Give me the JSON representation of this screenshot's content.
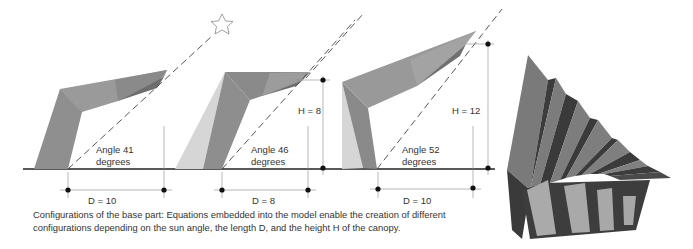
{
  "figure": {
    "colors": {
      "canopy_top": "#8c8c8c",
      "canopy_dark": "#6e6e6e",
      "canopy_mid": "#999999",
      "shadow_light": "#d4d4d4",
      "ground": "#222222",
      "dimension": "#888888",
      "render_dark": "#3a3a3a",
      "render_mid": "#787878",
      "render_light": "#a9a9a9"
    },
    "configurations": [
      {
        "id": 1,
        "angle_label": "Angle 41",
        "angle_unit": "degrees",
        "angle_deg": 41,
        "d_label": "D = 10",
        "d_value": 10,
        "h_label": null
      },
      {
        "id": 2,
        "angle_label": "Angle 46",
        "angle_unit": "degrees",
        "angle_deg": 46,
        "d_label": "D = 8",
        "d_value": 8,
        "h_label": "H = 8",
        "h_value": 8
      },
      {
        "id": 3,
        "angle_label": "Angle 52",
        "angle_unit": "degrees",
        "angle_deg": 52,
        "d_label": "D = 10",
        "d_value": 10,
        "h_label": "H = 12",
        "h_value": 12
      }
    ],
    "sun_icon": "star-outline-icon",
    "render_3d": "folded-canopy-array"
  },
  "caption": {
    "line1": "Configurations of the base part:  Equations embedded into the model enable the creation of different",
    "line2": "configurations depending on the sun angle, the length D, and the height H of the canopy."
  }
}
